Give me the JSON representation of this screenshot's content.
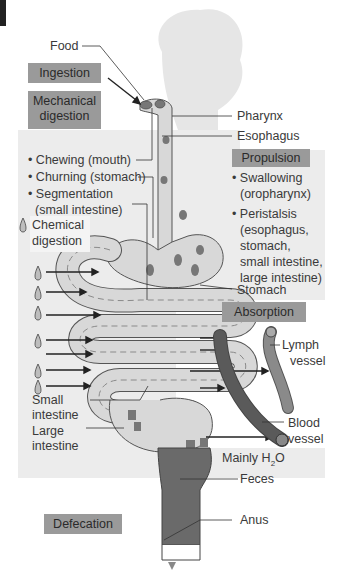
{
  "figure": {
    "title": "",
    "colors": {
      "panel_bg": "#ececec",
      "label_box": "#9a9a9a",
      "tract_fill": "#d8d8d8",
      "tract_stroke": "#555555",
      "feces": "#6a6a6a",
      "blood_vessel": "#585858",
      "lymph_vessel": "#8a8a8a",
      "absorption_panel": "#ffffff"
    }
  },
  "process_boxes": {
    "ingestion": "Ingestion",
    "mechanical_line1": "Mechanical",
    "mechanical_line2": "digestion",
    "propulsion": "Propulsion",
    "absorption": "Absorption",
    "defecation": "Defecation"
  },
  "mechanical_list": [
    "• Chewing (mouth)",
    "• Churning (stomach)",
    "• Segmentation",
    "(small intestine)"
  ],
  "chemical": {
    "line1": "Chemical",
    "line2": "digestion"
  },
  "propulsion_list": [
    "• Swallowing",
    "(oropharynx)",
    "• Peristalsis",
    "(esophagus,",
    "stomach,",
    "small intestine,",
    "large intestine)"
  ],
  "anatomy_labels": {
    "food": "Food",
    "pharynx": "Pharynx",
    "esophagus": "Esophagus",
    "stomach": "Stomach",
    "small_intestine_1": "Small",
    "small_intestine_2": "intestine",
    "large_intestine_1": "Large",
    "large_intestine_2": "intestine",
    "lymph_1": "Lymph",
    "lymph_2": "vessel",
    "blood_1": "Blood",
    "blood_2": "vessel",
    "water_prefix": "Mainly H",
    "water_sub": "2",
    "water_suffix": "O",
    "feces": "Feces",
    "anus": "Anus"
  }
}
